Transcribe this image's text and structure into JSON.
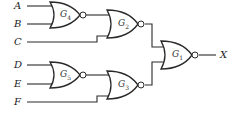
{
  "diagram": {
    "type": "logic-circuit",
    "inputs": [
      {
        "id": "A",
        "label": "A"
      },
      {
        "id": "B",
        "label": "B"
      },
      {
        "id": "C",
        "label": "C"
      },
      {
        "id": "D",
        "label": "D"
      },
      {
        "id": "E",
        "label": "E"
      },
      {
        "id": "F",
        "label": "F"
      }
    ],
    "gates": [
      {
        "id": "G4",
        "label": "G",
        "sub": "4",
        "kind": "NOR",
        "inputs": [
          "A",
          "B"
        ]
      },
      {
        "id": "G2",
        "label": "G",
        "sub": "2",
        "kind": "NOR",
        "inputs": [
          "G4",
          "C"
        ]
      },
      {
        "id": "G5",
        "label": "G",
        "sub": "5",
        "kind": "NOR",
        "inputs": [
          "D",
          "E"
        ]
      },
      {
        "id": "G3",
        "label": "G",
        "sub": "3",
        "kind": "NOR",
        "inputs": [
          "G5",
          "F"
        ]
      },
      {
        "id": "G1",
        "label": "G",
        "sub": "1",
        "kind": "NOR",
        "inputs": [
          "G2",
          "G3"
        ]
      }
    ],
    "output": {
      "id": "X",
      "label": "X"
    }
  }
}
